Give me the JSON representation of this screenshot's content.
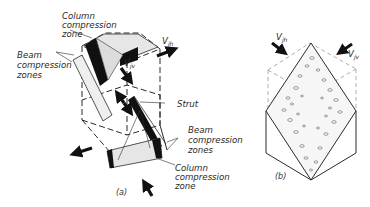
{
  "figure": {
    "panels": [
      {
        "id": "a",
        "caption": "(a)",
        "labels": {
          "column_top": [
            "Column",
            "compression",
            "zone"
          ],
          "beam_left": [
            "Beam",
            "compression",
            "zones"
          ],
          "strut": "Strut",
          "beam_right": [
            "Beam",
            "compression",
            "zones"
          ],
          "column_bottom": [
            "Column",
            "compression",
            "zone"
          ],
          "force_horizontal": {
            "main": "V",
            "sub": "jh"
          },
          "force_vertical": {
            "main": "V",
            "sub": "jv"
          }
        }
      },
      {
        "id": "b",
        "caption": "(b)",
        "labels": {
          "force_horizontal": {
            "main": "V",
            "sub": "jh"
          },
          "force_vertical": {
            "main": "V",
            "sub": "jv"
          }
        }
      }
    ],
    "colors": {
      "line": "#2b2b2b",
      "fill_dark": "#111111",
      "fill_light": "#e6e6e6",
      "dashed": "#9a9a9a"
    }
  }
}
